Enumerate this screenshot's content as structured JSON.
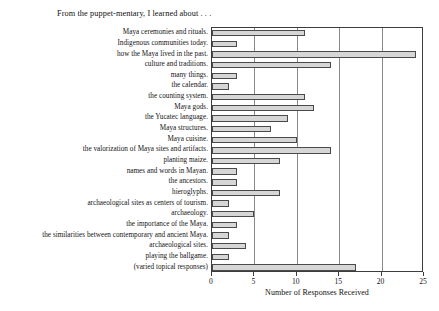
{
  "chart_data": {
    "type": "bar",
    "orientation": "horizontal",
    "title": "From the puppet-mentary, I learned about . . .",
    "xlabel": "Number of Responses Received",
    "ylabel": "",
    "xlim": [
      0,
      25
    ],
    "xticks": [
      0,
      5,
      10,
      15,
      20,
      25
    ],
    "grid": true,
    "grid_axis": "x",
    "legend": false,
    "bar_fill_color": "#d6d6d6",
    "bar_edge_color": "#4a4a4a",
    "categories": [
      "Maya ceremonies and rituals.",
      "Indigenous communities today.",
      "how the Maya lived in the past.",
      "culture and traditions.",
      "many things.",
      "the calendar.",
      "the counting system.",
      "Maya gods.",
      "the Yucatec language.",
      "Maya structures.",
      "Maya cuisine.",
      "the valorization of Maya sites and artifacts.",
      "planting maize.",
      "names and words in Mayan.",
      "the ancestors.",
      "hieroglyphs.",
      "archaeological sites as centers of tourism.",
      "archaeology.",
      "the importance of the Maya.",
      "the similarities between contemporary and ancient Maya.",
      "archaeological sites.",
      "playing the ballgame.",
      "(varied topical responses)"
    ],
    "values": [
      11,
      3,
      24,
      14,
      3,
      2,
      11,
      12,
      9,
      7,
      10,
      14,
      8,
      3,
      3,
      8,
      2,
      5,
      3,
      2,
      4,
      2,
      17
    ]
  }
}
